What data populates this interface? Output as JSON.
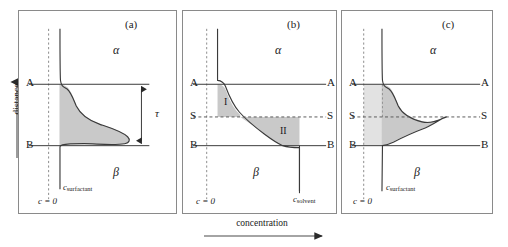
{
  "figure": {
    "axis_labels": {
      "y": "distance",
      "x": "concentration"
    },
    "colors": {
      "fill_dark": "#c9c9c9",
      "fill_light": "#dedede",
      "curve": "#3a3a3a",
      "border": "#8a8a8a",
      "dashed": "#7a7a7a"
    }
  },
  "panels": [
    {
      "id": "a",
      "caption": "(a)",
      "phase_upper": "α",
      "phase_lower": "β",
      "line_a": "A",
      "line_b": "B",
      "tau": "τ",
      "c_zero": "c = 0",
      "c_species": "c",
      "c_subscript": "surfactant"
    },
    {
      "id": "b",
      "caption": "(b)",
      "phase_upper": "α",
      "phase_lower": "β",
      "line_a_left": "A",
      "line_a_right": "A",
      "line_s_left": "S",
      "line_s_right": "S",
      "line_b_left": "B",
      "line_b_right": "B",
      "region_one": "I",
      "region_two": "II",
      "c_zero": "c = 0",
      "c_species": "c",
      "c_subscript": "solvent"
    },
    {
      "id": "c",
      "caption": "(c)",
      "phase_upper": "α",
      "phase_lower": "β",
      "line_a_left": "A",
      "line_a_right": "A",
      "line_s_left": "S",
      "line_s_right": "S",
      "line_b_left": "B",
      "line_b_right": "B",
      "c_zero": "c = 0",
      "c_species": "c",
      "c_subscript": "surfactant"
    }
  ]
}
